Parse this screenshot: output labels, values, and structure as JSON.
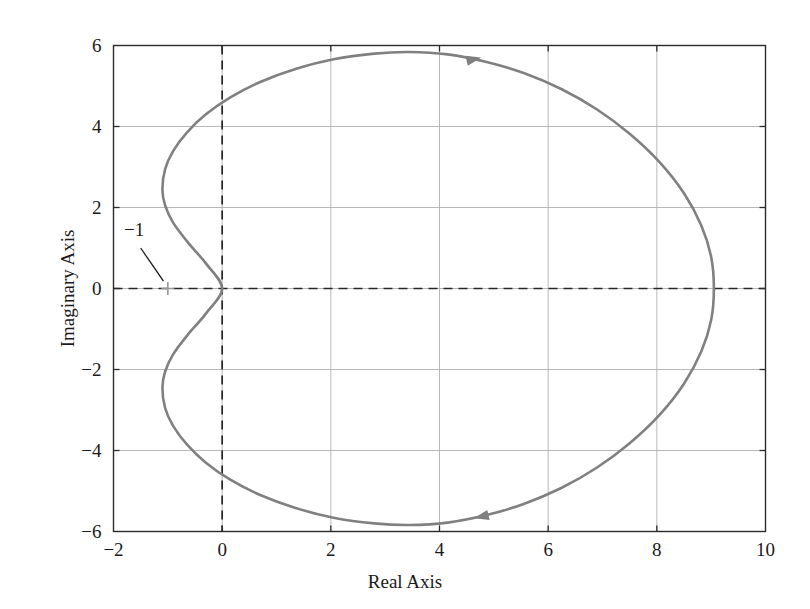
{
  "chart_data": {
    "type": "line",
    "title": "",
    "xlabel": "Real Axis",
    "ylabel": "Imaginary Axis",
    "xlim": [
      -2,
      10
    ],
    "ylim": [
      -6,
      6
    ],
    "xticks": [
      "-2",
      "0",
      "2",
      "4",
      "6",
      "8",
      "10"
    ],
    "xtick_values": [
      -2,
      0,
      2,
      4,
      6,
      8,
      10
    ],
    "yticks": [
      "-6",
      "-4",
      "-2",
      "0",
      "2",
      "4",
      "6"
    ],
    "ytick_values": [
      -6,
      -4,
      -2,
      0,
      2,
      4,
      6
    ],
    "grid": true,
    "legend": null,
    "series": [
      {
        "name": "Nyquist contour",
        "color": "#808080",
        "linewidth": 2.6,
        "closed": true,
        "points": [
          [
            0.0,
            0.0
          ],
          [
            -0.3,
            0.62
          ],
          [
            -0.62,
            1.12
          ],
          [
            -0.9,
            1.62
          ],
          [
            -1.05,
            2.05
          ],
          [
            -1.1,
            2.45
          ],
          [
            -1.05,
            2.95
          ],
          [
            -0.9,
            3.4
          ],
          [
            -0.65,
            3.85
          ],
          [
            -0.3,
            4.3
          ],
          [
            0.15,
            4.72
          ],
          [
            0.7,
            5.1
          ],
          [
            1.35,
            5.42
          ],
          [
            2.05,
            5.66
          ],
          [
            2.8,
            5.8
          ],
          [
            3.45,
            5.84
          ],
          [
            4.15,
            5.78
          ],
          [
            4.85,
            5.6
          ],
          [
            5.55,
            5.32
          ],
          [
            6.25,
            4.92
          ],
          [
            6.9,
            4.42
          ],
          [
            7.5,
            3.82
          ],
          [
            8.05,
            3.12
          ],
          [
            8.5,
            2.35
          ],
          [
            8.82,
            1.55
          ],
          [
            9.0,
            0.78
          ],
          [
            9.05,
            0.0
          ],
          [
            9.0,
            -0.78
          ],
          [
            8.82,
            -1.55
          ],
          [
            8.5,
            -2.35
          ],
          [
            8.05,
            -3.12
          ],
          [
            7.5,
            -3.82
          ],
          [
            6.9,
            -4.42
          ],
          [
            6.25,
            -4.92
          ],
          [
            5.55,
            -5.32
          ],
          [
            4.85,
            -5.6
          ],
          [
            4.15,
            -5.78
          ],
          [
            3.45,
            -5.84
          ],
          [
            2.8,
            -5.8
          ],
          [
            2.05,
            -5.66
          ],
          [
            1.35,
            -5.42
          ],
          [
            0.7,
            -5.1
          ],
          [
            0.15,
            -4.72
          ],
          [
            -0.3,
            -4.3
          ],
          [
            -0.65,
            -3.85
          ],
          [
            -0.9,
            -3.4
          ],
          [
            -1.05,
            -2.95
          ],
          [
            -1.1,
            -2.45
          ],
          [
            -1.05,
            -2.05
          ],
          [
            -0.9,
            -1.62
          ],
          [
            -0.62,
            -1.12
          ],
          [
            -0.3,
            -0.62
          ],
          [
            0.0,
            0.0
          ]
        ]
      }
    ],
    "direction_arrows": [
      {
        "name": "upper-arrow",
        "x": 4.62,
        "y": 5.66,
        "angle_deg": 13
      },
      {
        "name": "lower-arrow",
        "x": 4.78,
        "y": -5.63,
        "angle_deg": 193
      }
    ],
    "annotations": [
      {
        "name": "critical-point",
        "label": "−1",
        "marker": "plus",
        "marker_color": "#999999",
        "point_x": -1.0,
        "point_y": 0.0,
        "label_x": -1.62,
        "label_y": 1.3,
        "leader_from_x": -1.5,
        "leader_from_y": 1.0,
        "leader_to_x": -1.08,
        "leader_to_y": 0.18
      }
    ],
    "reference_lines": [
      {
        "name": "real-axis-dashed",
        "orientation": "horizontal",
        "value": 0,
        "style": "dashed",
        "color": "#262626"
      },
      {
        "name": "imag-axis-dashed",
        "orientation": "vertical",
        "value": 0,
        "style": "dashed",
        "color": "#262626"
      }
    ],
    "colors": {
      "curve": "#808080",
      "grid": "#b0b0b0",
      "frame": "#2b2b2b",
      "dashed_axis": "#262626",
      "marker": "#999999",
      "background": "#ffffff"
    }
  }
}
